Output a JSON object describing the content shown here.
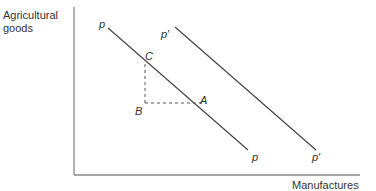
{
  "diagram": {
    "y_axis_label_line1": "Agricultural",
    "y_axis_label_line2": "goods",
    "x_axis_label": "Manufactures",
    "lines": [
      {
        "name": "p",
        "start_label": "p",
        "end_label": "p"
      },
      {
        "name": "p-prime",
        "start_label": "p′",
        "end_label": "p′"
      }
    ],
    "points": {
      "A": "A",
      "B": "B",
      "C": "C"
    },
    "colors": {
      "line": "#444444",
      "axis": "#777777",
      "text": "#333333"
    }
  }
}
